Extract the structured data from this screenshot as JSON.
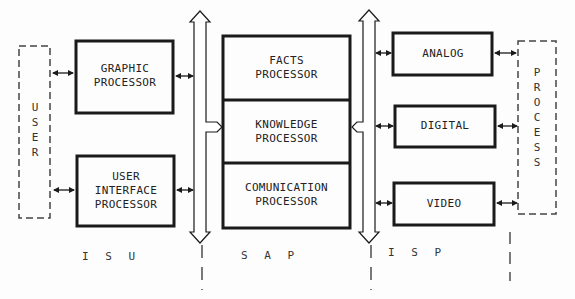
{
  "diagram": {
    "external": {
      "user": {
        "label": "USER",
        "letters": [
          "U",
          "S",
          "E",
          "R"
        ]
      },
      "process": {
        "label": "PROCESS",
        "letters": [
          "P",
          "R",
          "O",
          "C",
          "E",
          "S",
          "S"
        ]
      }
    },
    "isu": {
      "section_label": "I S U",
      "blocks": [
        {
          "id": "graphic",
          "lines": [
            "GRAPHIC",
            "PROCESSOR"
          ]
        },
        {
          "id": "user_interface",
          "lines": [
            "USER",
            "INTERFACE",
            "PROCESSOR"
          ]
        }
      ]
    },
    "sap": {
      "section_label": "S A P",
      "blocks": [
        {
          "id": "facts",
          "lines": [
            "FACTS",
            "PROCESSOR"
          ]
        },
        {
          "id": "knowledge",
          "lines": [
            "KNOWLEDGE",
            "PROCESSOR"
          ]
        },
        {
          "id": "communication",
          "lines": [
            "COMUNICATION",
            "PROCESSOR"
          ]
        }
      ]
    },
    "isp": {
      "section_label": "I S P",
      "blocks": [
        {
          "id": "analog",
          "lines": [
            "ANALOG"
          ]
        },
        {
          "id": "digital",
          "lines": [
            "DIGITAL"
          ]
        },
        {
          "id": "video",
          "lines": [
            "VIDEO"
          ]
        }
      ]
    },
    "colors": {
      "line": "#1a1a1a",
      "dashed": "#444444",
      "background": "#fdfdfd"
    }
  }
}
